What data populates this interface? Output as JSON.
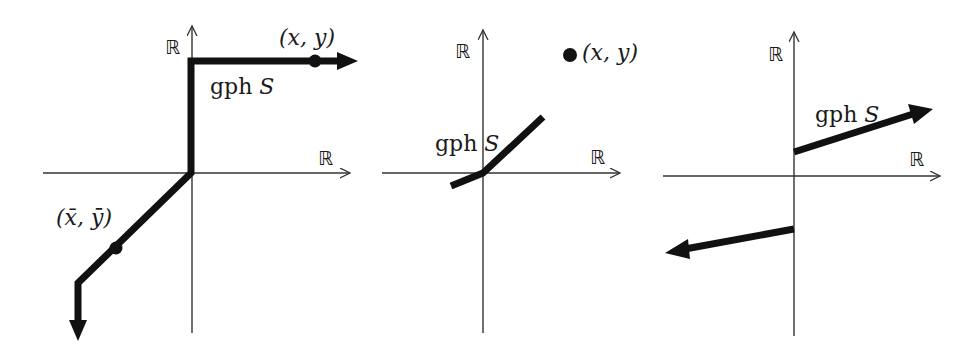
{
  "figure": {
    "panels": [
      {
        "id": "panel-1",
        "axis_x_label": "ℝ",
        "axis_y_label": "ℝ",
        "graph_label_prefix": "gph ",
        "graph_label_var": "S",
        "point_label": "(x, y)",
        "point_bar_label": "(x̄, ȳ)",
        "description": "gph S: vertical ray up the y-axis from origin, turning right along a horizontal ray (arrow) with point (x,y); diagonal segment down-left through (x̄,ȳ) turning into a downward vertical ray (arrow)"
      },
      {
        "id": "panel-2",
        "axis_x_label": "ℝ",
        "axis_y_label": "ℝ",
        "graph_label_prefix": "gph ",
        "graph_label_var": "S",
        "point_label": "(x, y)",
        "description": "gph S: bounded piecewise-linear segment through the origin; isolated point (x,y) off the graph"
      },
      {
        "id": "panel-3",
        "axis_x_label": "ℝ",
        "axis_y_label": "ℝ",
        "graph_label_prefix": "gph ",
        "graph_label_var": "S",
        "description": "gph S: two disjoint rays — one starting above the origin on the y-axis going up-right (arrow), one starting below going left (arrow)"
      }
    ]
  },
  "colors": {
    "background": "#ffffff",
    "axis": "#333333",
    "graph": "#111111"
  }
}
